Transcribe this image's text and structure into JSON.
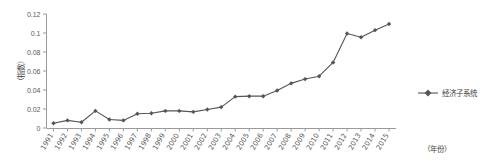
{
  "chart_data": {
    "type": "line",
    "title": "",
    "xlabel": "（年份）",
    "ylabel": "（指数）",
    "categories": [
      "1991",
      "1992",
      "1993",
      "1994",
      "1995",
      "1996",
      "1997",
      "1998",
      "1999",
      "2000",
      "2001",
      "2002",
      "2003",
      "2004",
      "2005",
      "2006",
      "2007",
      "2008",
      "2009",
      "2010",
      "2011",
      "2012",
      "2013",
      "2014",
      "2015"
    ],
    "series": [
      {
        "name": "经济子系统",
        "values": [
          0.005,
          0.008,
          0.006,
          0.018,
          0.009,
          0.008,
          0.015,
          0.0155,
          0.018,
          0.018,
          0.017,
          0.0195,
          0.022,
          0.033,
          0.0335,
          0.0335,
          0.0395,
          0.047,
          0.0515,
          0.0545,
          0.069,
          0.0995,
          0.0955,
          0.103,
          0.1095
        ],
        "color": "#555555",
        "marker": "diamond"
      }
    ],
    "ylim": [
      0,
      0.12
    ],
    "ytick_values": [
      0,
      0.02,
      0.04,
      0.06,
      0.08,
      0.1,
      0.12
    ],
    "ytick_labels": [
      "0",
      "0.02",
      "0.04",
      "0.06",
      "0.08",
      "0.1",
      "0.12"
    ],
    "grid": false,
    "legend_position": "right",
    "axis_color": "#9a9a9a"
  },
  "legend": {
    "entries": [
      {
        "label": "经济子系统"
      }
    ]
  },
  "axes": {
    "y_title": "（指数）",
    "x_title": "（年份）"
  }
}
